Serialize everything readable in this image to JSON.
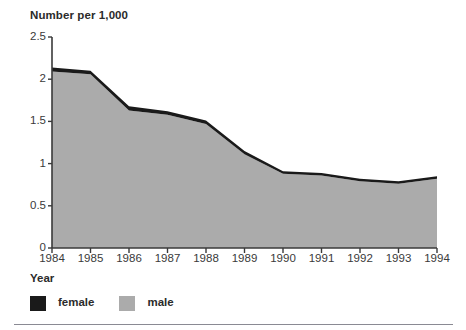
{
  "chart": {
    "title": "Number per 1,000",
    "xlabel": "Year",
    "ylabel": ""
  },
  "yticks": [
    "2.5",
    "2",
    "1.5",
    "1",
    "0.5",
    "0"
  ],
  "xticks": [
    "1984",
    "1985",
    "1986",
    "1987",
    "1988",
    "1989",
    "1990",
    "1991",
    "1992",
    "1993",
    "1994"
  ],
  "legend": {
    "items": [
      {
        "label": "female",
        "color": "#1a1a1a",
        "swatch_name": "legend-swatch-female"
      },
      {
        "label": "male",
        "color": "#ababab",
        "swatch_name": "legend-swatch-male"
      }
    ]
  },
  "colors": {
    "female": "#1a1a1a",
    "male": "#ababab",
    "axis": "#3a3a3a",
    "text": "#2b2b2b",
    "rule": "#8a8a93",
    "background": "#ffffff"
  },
  "chart_data": {
    "type": "area",
    "title": "Number per 1,000",
    "xlabel": "Year",
    "ylabel": "Number per 1,000",
    "stacked": true,
    "grid": false,
    "legend_position": "bottom-left",
    "categories": [
      "1984",
      "1985",
      "1986",
      "1987",
      "1988",
      "1989",
      "1990",
      "1991",
      "1992",
      "1993",
      "1994"
    ],
    "x": [
      1984,
      1985,
      1986,
      1987,
      1988,
      1989,
      1990,
      1991,
      1992,
      1993,
      1994
    ],
    "ylim": [
      0,
      2.5
    ],
    "yticks": [
      0,
      0.5,
      1,
      1.5,
      2,
      2.5
    ],
    "series": [
      {
        "name": "male",
        "color": "#ababab",
        "values": [
          2.09,
          2.06,
          1.63,
          1.58,
          1.47,
          1.11,
          0.88,
          0.86,
          0.79,
          0.76,
          0.82
        ]
      },
      {
        "name": "female",
        "color": "#1a1a1a",
        "values": [
          0.05,
          0.04,
          0.05,
          0.04,
          0.04,
          0.04,
          0.03,
          0.03,
          0.03,
          0.03,
          0.03
        ]
      }
    ],
    "totals": [
      2.14,
      2.1,
      1.68,
      1.62,
      1.51,
      1.15,
      0.91,
      0.89,
      0.82,
      0.79,
      0.85
    ]
  },
  "geometry": {
    "plot_left": 52,
    "plot_right": 437,
    "plot_top": 37,
    "plot_bottom": 248,
    "y_max": 2.5
  }
}
